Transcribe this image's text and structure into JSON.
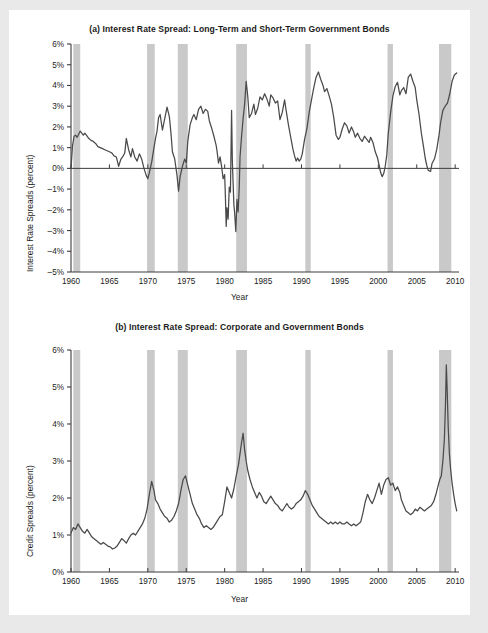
{
  "figure": {
    "background": "#ffffff",
    "page_border": "#e9e9e9",
    "line_color": "#4a4a4a",
    "recession_band_color": "#c9c9c9",
    "axis_color": "#3c3c3c"
  },
  "panels": [
    {
      "id": "a",
      "title": "(a) Interest Rate Spread: Long-Term and Short-Term Government Bonds",
      "ylabel": "Interest Rate Spreads (percent)",
      "xlabel": "Year"
    },
    {
      "id": "b",
      "title": "(b) Interest Rate Spread: Corporate and Government Bonds",
      "ylabel": "Credit Spreads (percent)",
      "xlabel": "Year"
    }
  ],
  "chart_data": [
    {
      "type": "line",
      "panel": "a",
      "title": "(a) Interest Rate Spread: Long-Term and Short-Term Government Bonds",
      "xlabel": "Year",
      "ylabel": "Interest Rate Spreads (percent)",
      "xlim": [
        1960,
        2010.5
      ],
      "ylim": [
        -5,
        6
      ],
      "yticks": [
        6,
        5,
        4,
        3,
        2,
        1,
        0,
        -1,
        -2,
        -3,
        -4,
        -5
      ],
      "ytick_labels": [
        "6%",
        "5%",
        "4%",
        "3%",
        "2%",
        "1%",
        "0%",
        "-1%",
        "-2%",
        "-3%",
        "-4%",
        "-5%"
      ],
      "xticks": [
        1960,
        1965,
        1970,
        1975,
        1980,
        1985,
        1990,
        1995,
        2000,
        2005,
        2010
      ],
      "xtick_labels": [
        "1960",
        "1965",
        "1970",
        "1975",
        "1980",
        "1985",
        "1990",
        "1995",
        "2000",
        "2005",
        "2010"
      ],
      "grid": false,
      "zero_line": true,
      "recessions": [
        [
          1960.3,
          1961.2
        ],
        [
          1969.9,
          1970.9
        ],
        [
          1973.9,
          1975.2
        ],
        [
          1981.5,
          1982.9
        ],
        [
          1990.5,
          1991.2
        ],
        [
          2001.2,
          2001.9
        ],
        [
          2007.9,
          2009.5
        ]
      ],
      "series": [
        {
          "name": "Long-term minus short-term government bond spread",
          "x": [
            1960.0,
            1960.2,
            1960.4,
            1960.6,
            1960.8,
            1961.0,
            1961.2,
            1961.4,
            1961.6,
            1961.8,
            1962.0,
            1962.3,
            1962.6,
            1962.9,
            1963.2,
            1963.5,
            1963.8,
            1964.1,
            1964.4,
            1964.7,
            1965.0,
            1965.3,
            1965.6,
            1965.9,
            1966.2,
            1966.5,
            1966.8,
            1967.0,
            1967.2,
            1967.5,
            1967.8,
            1968.0,
            1968.3,
            1968.6,
            1968.9,
            1969.2,
            1969.5,
            1969.8,
            1970.0,
            1970.2,
            1970.5,
            1970.8,
            1971.0,
            1971.2,
            1971.4,
            1971.6,
            1971.9,
            1972.2,
            1972.5,
            1972.8,
            1973.0,
            1973.2,
            1973.5,
            1973.8,
            1974.0,
            1974.2,
            1974.5,
            1974.8,
            1975.0,
            1975.2,
            1975.5,
            1975.8,
            1976.0,
            1976.3,
            1976.6,
            1976.9,
            1977.2,
            1977.5,
            1977.8,
            1978.0,
            1978.3,
            1978.6,
            1978.9,
            1979.0,
            1979.2,
            1979.4,
            1979.6,
            1979.8,
            1980.0,
            1980.1,
            1980.2,
            1980.3,
            1980.45,
            1980.6,
            1980.75,
            1980.9,
            1981.0,
            1981.1,
            1981.2,
            1981.3,
            1981.45,
            1981.6,
            1981.75,
            1981.9,
            1982.0,
            1982.2,
            1982.4,
            1982.6,
            1982.8,
            1983.0,
            1983.2,
            1983.5,
            1983.8,
            1984.0,
            1984.3,
            1984.6,
            1984.9,
            1985.2,
            1985.5,
            1985.8,
            1986.0,
            1986.3,
            1986.6,
            1986.9,
            1987.2,
            1987.5,
            1987.8,
            1988.0,
            1988.3,
            1988.6,
            1988.9,
            1989.1,
            1989.3,
            1989.5,
            1989.7,
            1989.9,
            1990.1,
            1990.4,
            1990.7,
            1991.0,
            1991.3,
            1991.6,
            1991.9,
            1992.2,
            1992.5,
            1992.8,
            1993.0,
            1993.3,
            1993.6,
            1993.9,
            1994.2,
            1994.5,
            1994.8,
            1995.0,
            1995.3,
            1995.6,
            1995.9,
            1996.2,
            1996.5,
            1996.8,
            1997.0,
            1997.3,
            1997.6,
            1997.9,
            1998.2,
            1998.5,
            1998.8,
            1999.0,
            1999.3,
            1999.6,
            1999.9,
            2000.1,
            2000.3,
            2000.5,
            2000.7,
            2000.9,
            2001.1,
            2001.3,
            2001.6,
            2001.9,
            2002.2,
            2002.5,
            2002.8,
            2003.0,
            2003.3,
            2003.6,
            2003.9,
            2004.2,
            2004.5,
            2004.8,
            2005.0,
            2005.3,
            2005.6,
            2005.9,
            2006.1,
            2006.3,
            2006.5,
            2006.8,
            2007.0,
            2007.3,
            2007.6,
            2007.9,
            2008.1,
            2008.4,
            2008.7,
            2009.0,
            2009.3,
            2009.6,
            2009.9,
            2010.2
          ],
          "y": [
            0.0,
            1.1,
            1.55,
            1.6,
            1.5,
            1.65,
            1.8,
            1.7,
            1.6,
            1.7,
            1.6,
            1.45,
            1.35,
            1.3,
            1.2,
            1.05,
            1.0,
            0.95,
            0.9,
            0.85,
            0.8,
            0.75,
            0.6,
            0.55,
            0.1,
            0.45,
            0.6,
            0.75,
            1.45,
            0.9,
            0.55,
            0.95,
            0.55,
            0.35,
            0.7,
            0.45,
            0.0,
            -0.35,
            -0.5,
            -0.2,
            0.3,
            1.0,
            1.45,
            1.8,
            2.45,
            2.6,
            1.85,
            2.4,
            2.95,
            2.5,
            1.75,
            0.8,
            0.45,
            -0.35,
            -1.1,
            -0.4,
            0.1,
            0.45,
            0.25,
            1.3,
            2.1,
            2.45,
            2.6,
            2.35,
            2.85,
            3.0,
            2.65,
            2.85,
            2.75,
            2.3,
            1.95,
            1.55,
            1.1,
            0.85,
            0.25,
            0.55,
            0.1,
            -0.5,
            -0.3,
            -1.4,
            -2.8,
            -1.9,
            -2.45,
            -0.9,
            -1.15,
            2.8,
            0.35,
            -0.7,
            -1.75,
            -2.15,
            -3.05,
            -1.5,
            -2.1,
            -0.9,
            0.55,
            1.55,
            2.4,
            3.1,
            4.2,
            3.5,
            2.45,
            2.65,
            3.1,
            2.6,
            2.9,
            3.45,
            3.3,
            3.6,
            3.35,
            3.0,
            3.55,
            3.4,
            3.15,
            3.25,
            2.35,
            2.7,
            3.3,
            2.8,
            2.1,
            1.5,
            0.9,
            0.6,
            0.35,
            0.5,
            0.35,
            0.45,
            0.7,
            1.4,
            1.9,
            2.7,
            3.3,
            3.9,
            4.4,
            4.65,
            4.3,
            4.0,
            3.7,
            3.85,
            3.5,
            3.1,
            2.45,
            1.6,
            1.4,
            1.5,
            1.9,
            2.2,
            2.05,
            1.7,
            2.0,
            1.75,
            1.5,
            1.7,
            1.45,
            1.3,
            1.55,
            1.4,
            1.25,
            1.5,
            1.25,
            0.8,
            0.5,
            0.15,
            -0.2,
            -0.4,
            -0.25,
            0.1,
            0.65,
            1.7,
            2.7,
            3.5,
            3.95,
            4.15,
            3.55,
            3.75,
            3.9,
            3.6,
            4.4,
            4.55,
            4.2,
            3.9,
            3.3,
            2.6,
            1.7,
            1.0,
            0.5,
            0.15,
            -0.1,
            -0.15,
            0.25,
            0.45,
            0.9,
            1.6,
            2.2,
            2.8,
            3.0,
            3.15,
            3.6,
            4.2,
            4.5,
            4.6
          ]
        }
      ]
    },
    {
      "type": "line",
      "panel": "b",
      "title": "(b) Interest Rate Spread: Corporate and Government Bonds",
      "xlabel": "Year",
      "ylabel": "Credit Spreads (percent)",
      "xlim": [
        1960,
        2010.5
      ],
      "ylim": [
        0,
        6
      ],
      "yticks": [
        6,
        5,
        4,
        3,
        2,
        1,
        0
      ],
      "ytick_labels": [
        "6%",
        "5%",
        "4%",
        "3%",
        "2%",
        "1%",
        "0%"
      ],
      "xticks": [
        1960,
        1965,
        1970,
        1975,
        1980,
        1985,
        1990,
        1995,
        2000,
        2005,
        2010
      ],
      "xtick_labels": [
        "1960",
        "1965",
        "1970",
        "1975",
        "1980",
        "1985",
        "1990",
        "1995",
        "2000",
        "2005",
        "2010"
      ],
      "grid": false,
      "zero_line": false,
      "recessions": [
        [
          1960.3,
          1961.2
        ],
        [
          1969.9,
          1970.9
        ],
        [
          1973.9,
          1975.2
        ],
        [
          1981.5,
          1982.9
        ],
        [
          1990.5,
          1991.2
        ],
        [
          2001.2,
          2001.9
        ],
        [
          2007.9,
          2009.5
        ]
      ],
      "series": [
        {
          "name": "Corporate minus government bond credit spread",
          "x": [
            1960.0,
            1960.3,
            1960.6,
            1960.9,
            1961.2,
            1961.5,
            1961.8,
            1962.1,
            1962.4,
            1962.7,
            1963.0,
            1963.3,
            1963.6,
            1963.9,
            1964.2,
            1964.5,
            1964.8,
            1965.1,
            1965.4,
            1965.7,
            1966.0,
            1966.3,
            1966.6,
            1966.9,
            1967.2,
            1967.5,
            1967.8,
            1968.1,
            1968.4,
            1968.7,
            1969.0,
            1969.3,
            1969.6,
            1969.9,
            1970.2,
            1970.5,
            1970.8,
            1971.0,
            1971.3,
            1971.6,
            1971.9,
            1972.2,
            1972.5,
            1972.8,
            1973.1,
            1973.4,
            1973.7,
            1974.0,
            1974.3,
            1974.6,
            1974.9,
            1975.2,
            1975.5,
            1975.8,
            1976.1,
            1976.4,
            1976.7,
            1977.0,
            1977.3,
            1977.6,
            1977.9,
            1978.2,
            1978.5,
            1978.8,
            1979.1,
            1979.4,
            1979.7,
            1980.0,
            1980.3,
            1980.6,
            1980.9,
            1981.2,
            1981.5,
            1981.8,
            1982.0,
            1982.2,
            1982.4,
            1982.6,
            1982.8,
            1983.0,
            1983.3,
            1983.6,
            1983.9,
            1984.2,
            1984.5,
            1984.8,
            1985.1,
            1985.4,
            1985.7,
            1986.0,
            1986.3,
            1986.6,
            1986.9,
            1987.2,
            1987.5,
            1987.8,
            1988.1,
            1988.4,
            1988.7,
            1989.0,
            1989.3,
            1989.6,
            1989.9,
            1990.2,
            1990.5,
            1990.8,
            1991.1,
            1991.4,
            1991.7,
            1992.0,
            1992.3,
            1992.6,
            1992.9,
            1993.2,
            1993.5,
            1993.8,
            1994.1,
            1994.4,
            1994.7,
            1995.0,
            1995.3,
            1995.6,
            1995.9,
            1996.2,
            1996.5,
            1996.8,
            1997.1,
            1997.4,
            1997.7,
            1998.0,
            1998.3,
            1998.6,
            1998.9,
            1999.2,
            1999.5,
            1999.8,
            2000.1,
            2000.4,
            2000.7,
            2001.0,
            2001.3,
            2001.6,
            2001.9,
            2002.2,
            2002.5,
            2002.8,
            2003.0,
            2003.3,
            2003.6,
            2003.9,
            2004.2,
            2004.5,
            2004.8,
            2005.1,
            2005.4,
            2005.7,
            2006.0,
            2006.3,
            2006.6,
            2006.9,
            2007.2,
            2007.5,
            2007.8,
            2008.0,
            2008.2,
            2008.4,
            2008.6,
            2008.75,
            2008.85,
            2008.95,
            2009.1,
            2009.25,
            2009.4,
            2009.6,
            2009.8,
            2010.0,
            2010.2
          ],
          "y": [
            1.05,
            1.2,
            1.15,
            1.3,
            1.2,
            1.1,
            1.05,
            1.15,
            1.05,
            0.95,
            0.9,
            0.85,
            0.8,
            0.75,
            0.8,
            0.75,
            0.7,
            0.68,
            0.62,
            0.65,
            0.7,
            0.8,
            0.9,
            0.85,
            0.78,
            0.9,
            1.0,
            1.05,
            1.0,
            1.1,
            1.2,
            1.3,
            1.45,
            1.7,
            2.1,
            2.45,
            2.2,
            1.95,
            1.85,
            1.7,
            1.6,
            1.5,
            1.45,
            1.35,
            1.4,
            1.5,
            1.65,
            1.85,
            2.2,
            2.5,
            2.6,
            2.35,
            2.1,
            1.85,
            1.7,
            1.55,
            1.45,
            1.3,
            1.2,
            1.25,
            1.2,
            1.15,
            1.2,
            1.3,
            1.4,
            1.5,
            1.55,
            1.9,
            2.3,
            2.15,
            2.0,
            2.25,
            2.6,
            2.9,
            3.2,
            3.5,
            3.75,
            3.3,
            3.0,
            2.75,
            2.5,
            2.3,
            2.15,
            2.0,
            2.15,
            2.05,
            1.9,
            1.85,
            1.95,
            2.05,
            1.95,
            1.85,
            1.8,
            1.7,
            1.65,
            1.75,
            1.85,
            1.75,
            1.7,
            1.75,
            1.85,
            1.9,
            1.95,
            2.05,
            2.2,
            2.1,
            1.95,
            1.8,
            1.7,
            1.6,
            1.5,
            1.45,
            1.4,
            1.35,
            1.3,
            1.35,
            1.3,
            1.35,
            1.3,
            1.35,
            1.3,
            1.3,
            1.35,
            1.3,
            1.25,
            1.3,
            1.25,
            1.3,
            1.35,
            1.6,
            1.9,
            2.1,
            1.95,
            1.85,
            2.0,
            2.2,
            2.4,
            2.1,
            2.35,
            2.5,
            2.55,
            2.35,
            2.4,
            2.2,
            2.3,
            2.15,
            1.95,
            1.8,
            1.65,
            1.6,
            1.55,
            1.6,
            1.7,
            1.65,
            1.75,
            1.7,
            1.65,
            1.7,
            1.75,
            1.8,
            1.9,
            2.1,
            2.35,
            2.5,
            2.6,
            3.0,
            3.6,
            4.6,
            5.6,
            5.0,
            3.9,
            3.2,
            2.8,
            2.4,
            2.1,
            1.85,
            1.65
          ]
        }
      ]
    }
  ]
}
